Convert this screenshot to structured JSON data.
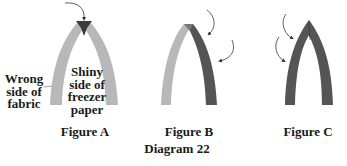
{
  "diagram": {
    "title": "Diagram 22",
    "colors": {
      "light_fabric": "#b8b8b8",
      "dark_fabric": "#555555",
      "tip": "#3a3a3a",
      "arrow": "#333333",
      "text": "#1a1a1a"
    },
    "figures": [
      {
        "caption": "Figure A",
        "labels": {
          "wrong_side": [
            "Wrong",
            "side of",
            "fabric"
          ],
          "shiny_side": [
            "Shiny",
            "side of",
            "freezer",
            "paper"
          ]
        }
      },
      {
        "caption": "Figure B"
      },
      {
        "caption": "Figure C"
      }
    ]
  }
}
